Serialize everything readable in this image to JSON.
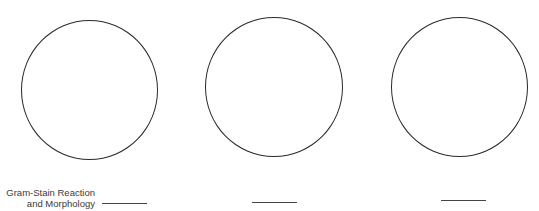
{
  "worksheet": {
    "specimens": [
      {
        "id": "circle-1",
        "answer": ""
      },
      {
        "id": "circle-2",
        "answer": ""
      },
      {
        "id": "circle-3",
        "answer": ""
      }
    ],
    "row_label": {
      "line1": "Gram-Stain Reaction",
      "line2": "and Morphology"
    }
  }
}
